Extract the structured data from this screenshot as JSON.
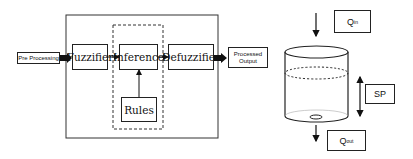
{
  "fuzzy_controller": {
    "pre_processing": "Pre Processing",
    "fuzzifier": "Fuzzifier",
    "inference": "Inference",
    "rules": "Rules",
    "defuzzifier": "Defuzzifier",
    "processed_output_line1": "Processed",
    "processed_output_line2": "Output"
  },
  "tank": {
    "q_in_main": "Q",
    "q_in_sub": "in",
    "q_out_main": "Q",
    "q_out_sub": "out",
    "setpoint": "SP"
  }
}
